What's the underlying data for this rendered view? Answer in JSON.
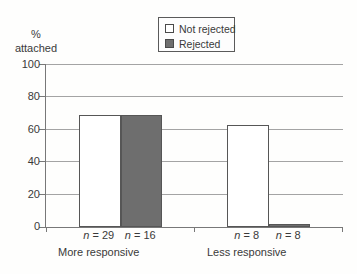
{
  "colors": {
    "background": "#fefefd",
    "series_fills": [
      "#ffffff",
      "#6e6e6e"
    ],
    "bar_outline": "#565656",
    "gridline": "#a4a4a4",
    "axis": "#787878",
    "text": "#3a3a3a"
  },
  "y_axis_title": {
    "line1": "%",
    "line2": "attached"
  },
  "chart_data": {
    "type": "bar",
    "title": "",
    "ylabel_line1": "%",
    "ylabel_line2": "attached",
    "categories": [
      "More responsive",
      "Less responsive"
    ],
    "series": [
      {
        "name": "Not rejected",
        "values": [
          69,
          63
        ],
        "n_labels": [
          "n = 29",
          "n = 8"
        ]
      },
      {
        "name": "Rejected",
        "values": [
          69,
          2
        ],
        "n_labels": [
          "n = 16",
          "n = 8"
        ]
      }
    ],
    "ylim": [
      0,
      100
    ],
    "yticks": [
      0,
      20,
      40,
      60,
      80,
      100
    ],
    "grid": true,
    "legend_position": "top-center-above-plot"
  }
}
